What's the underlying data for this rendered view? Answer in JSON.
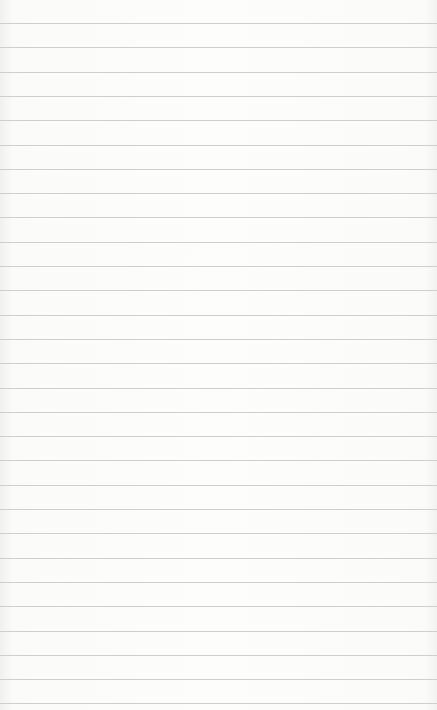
{
  "paper": {
    "type": "lined-notepad",
    "background_color": "#fcfcfb",
    "line_color": "#cfcfcd",
    "first_line_y": 23,
    "line_spacing": 24.3,
    "line_count": 29
  }
}
